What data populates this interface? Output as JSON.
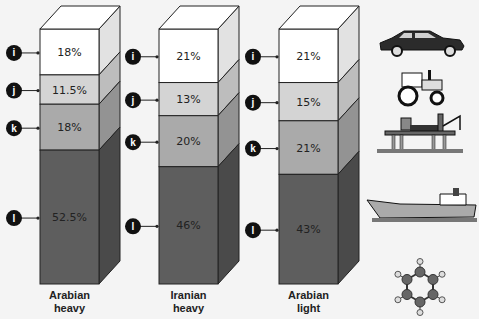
{
  "chart_data": {
    "type": "bar",
    "subtype": "stacked-3d-column",
    "title": "",
    "categories": [
      "Arabian heavy",
      "Iranian heavy",
      "Arabian light"
    ],
    "category_lines": [
      [
        "Arabian",
        "heavy"
      ],
      [
        "Iranian",
        "heavy"
      ],
      [
        "Arabian",
        "light"
      ]
    ],
    "series": [
      {
        "name": "i",
        "label": "i",
        "values": [
          18,
          21,
          21
        ],
        "labels": [
          "18%",
          "21%",
          "21%"
        ],
        "color": "#ffffff",
        "side_color": "#e2e2e2",
        "icon": "car-icon"
      },
      {
        "name": "j",
        "label": "j",
        "values": [
          11.5,
          13,
          15
        ],
        "labels": [
          "11.5%",
          "13%",
          "15%"
        ],
        "color": "#d4d4d4",
        "side_color": "#bdbdbd",
        "icon": "tractor-icon"
      },
      {
        "name": "k",
        "label": "k",
        "values": [
          18,
          20,
          21
        ],
        "labels": [
          "18%",
          "20%",
          "21%"
        ],
        "color": "#aaaaaa",
        "side_color": "#939393",
        "icon": "oil-platform-icon"
      },
      {
        "name": "l",
        "label": "l",
        "values": [
          52.5,
          46,
          43
        ],
        "labels": [
          "52.5%",
          "46%",
          "43%"
        ],
        "color": "#5e5e5e",
        "side_color": "#4a4a4a",
        "icon": "tanker-ship-icon"
      }
    ],
    "extra_icons": [
      "benzene-molecule-icon"
    ],
    "ylim": [
      0,
      100
    ],
    "grid": false,
    "legend": "marker-labels-left"
  },
  "colors": {
    "background": "#f4f4f4",
    "outline": "#222222",
    "marker": "#111111"
  }
}
